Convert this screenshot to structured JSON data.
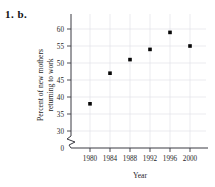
{
  "problem": {
    "label": "1. b."
  },
  "chart_data": {
    "type": "scatter",
    "title": "",
    "xlabel": "Year",
    "ylabel": "Percent of new mothers returning to work",
    "ylabel_line1": "Percent of new mothers",
    "ylabel_line2": "returning to work",
    "x": [
      1980,
      1984,
      1988,
      1992,
      1996,
      2000
    ],
    "values": [
      38,
      47,
      51,
      54,
      59,
      55
    ],
    "categories": [
      "1980",
      "1984",
      "1988",
      "1992",
      "1996",
      "2000"
    ],
    "xtick_labels": [
      "1980",
      "1984",
      "1988",
      "1992",
      "1996",
      "2000"
    ],
    "ytick_labels": [
      "0",
      "30",
      "35",
      "40",
      "45",
      "50",
      "55",
      "60"
    ],
    "ytick_values": [
      0,
      30,
      35,
      40,
      45,
      50,
      55,
      60
    ],
    "ylim": [
      30,
      60
    ],
    "xlim": [
      1978,
      2002
    ],
    "axis_break": true,
    "axis_break_axis": "y",
    "grid": true,
    "legend": "none",
    "marker": "filled-square",
    "marker_color": "#080808",
    "grid_color": "#e3e3e8",
    "axis_color": "#3a3a42"
  }
}
